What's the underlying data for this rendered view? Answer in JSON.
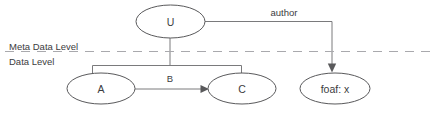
{
  "diagram": {
    "type": "layered-node-edge-diagram",
    "background_color": "#ffffff",
    "node_stroke_color": "#59595b",
    "edge_stroke_color": "#7a7a7c",
    "divider_color": "#a9a9ad",
    "text_color": "#3c3c3e",
    "levels": [
      {
        "id": "meta-data-level",
        "label": "Meta Data Level"
      },
      {
        "id": "data-level",
        "label": "Data Level"
      }
    ],
    "nodes": [
      {
        "id": "u",
        "label": "U",
        "level": "meta-data-level"
      },
      {
        "id": "a",
        "label": "A",
        "level": "data-level"
      },
      {
        "id": "c",
        "label": "C",
        "level": "data-level"
      },
      {
        "id": "foaf-x",
        "label": "foaf: x",
        "level": "data-level"
      }
    ],
    "edges": [
      {
        "id": "u-author-foafx",
        "label": "author",
        "from": "u",
        "to": "foaf-x",
        "arrow": true
      },
      {
        "id": "a-b-c",
        "label": "B",
        "from": "a",
        "to": "c",
        "arrow": true
      },
      {
        "id": "u-bracket-a-c",
        "label": "",
        "from": "u",
        "to": "a, c",
        "arrow": false
      }
    ]
  }
}
